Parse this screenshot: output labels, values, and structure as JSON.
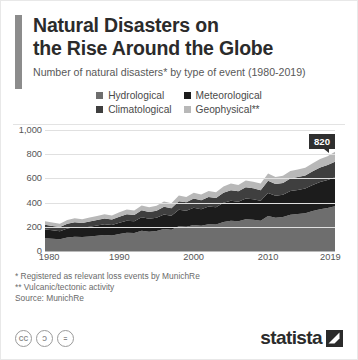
{
  "header": {
    "title_line1": "Natural Disasters on",
    "title_line2": "the Rise Around the Globe",
    "subtitle": "Number of natural disasters* by type of event (1980-2019)"
  },
  "legend": [
    {
      "label": "Hydrological",
      "color": "#6e6e6e"
    },
    {
      "label": "Meteorological",
      "color": "#1c1c1c"
    },
    {
      "label": "Climatological",
      "color": "#3f3f3f"
    },
    {
      "label": "Geophysical**",
      "color": "#b8b8b8"
    }
  ],
  "callout": {
    "value": "820"
  },
  "notes": {
    "note1": "*  Registered as relevant loss events by MunichRe",
    "note2": "** Vulcanic/tectonic activity",
    "source": "Source: MunichRe"
  },
  "footer": {
    "cc_icons": [
      "cc",
      "by",
      "nd"
    ],
    "cc_glyphs": [
      "CC",
      "Ɔ",
      "="
    ],
    "brand": "statista"
  },
  "chart_data": {
    "type": "area",
    "stacked": true,
    "title": "Number of natural disasters* by type of event (1980-2019)",
    "xlabel": "",
    "ylabel": "",
    "ylim": [
      0,
      1000
    ],
    "yticks": [
      0,
      200,
      400,
      600,
      800,
      1000
    ],
    "ytick_labels": [
      "0",
      "200",
      "400",
      "600",
      "800",
      "1,000"
    ],
    "xlim": [
      1980,
      2019
    ],
    "xticks": [
      1980,
      1990,
      2000,
      2010,
      2019
    ],
    "xtick_labels": [
      "1980",
      "1990",
      "2000",
      "2010",
      "2019"
    ],
    "grid": true,
    "legend_position": "top",
    "x": [
      1980,
      1981,
      1982,
      1983,
      1984,
      1985,
      1986,
      1987,
      1988,
      1989,
      1990,
      1991,
      1992,
      1993,
      1994,
      1995,
      1996,
      1997,
      1998,
      1999,
      2000,
      2001,
      2002,
      2003,
      2004,
      2005,
      2006,
      2007,
      2008,
      2009,
      2010,
      2011,
      2012,
      2013,
      2014,
      2015,
      2016,
      2017,
      2018,
      2019
    ],
    "series": [
      {
        "name": "Hydrological",
        "color": "#6e6e6e",
        "values": [
          106,
          101,
          98,
          112,
          118,
          116,
          120,
          126,
          133,
          128,
          140,
          150,
          148,
          168,
          160,
          165,
          182,
          175,
          205,
          200,
          215,
          208,
          222,
          218,
          240,
          250,
          245,
          262,
          258,
          250,
          290,
          275,
          280,
          300,
          305,
          312,
          330,
          345,
          355,
          370
        ]
      },
      {
        "name": "Meteorological",
        "color": "#1c1c1c",
        "values": [
          72,
          70,
          66,
          74,
          78,
          76,
          80,
          84,
          88,
          86,
          94,
          100,
          98,
          110,
          106,
          110,
          120,
          116,
          135,
          132,
          142,
          138,
          146,
          144,
          158,
          165,
          162,
          172,
          170,
          165,
          190,
          182,
          185,
          196,
          200,
          205,
          215,
          225,
          232,
          240
        ]
      },
      {
        "name": "Climatological",
        "color": "#3f3f3f",
        "values": [
          38,
          36,
          34,
          40,
          42,
          40,
          44,
          46,
          48,
          46,
          50,
          54,
          52,
          58,
          56,
          58,
          64,
          62,
          72,
          70,
          76,
          74,
          78,
          76,
          84,
          88,
          86,
          92,
          90,
          88,
          100,
          96,
          98,
          104,
          106,
          108,
          114,
          120,
          124,
          128
        ]
      },
      {
        "name": "Geophysical**",
        "color": "#b8b8b8",
        "values": [
          30,
          29,
          28,
          31,
          32,
          31,
          33,
          34,
          35,
          34,
          36,
          38,
          37,
          40,
          39,
          40,
          43,
          42,
          46,
          45,
          48,
          47,
          49,
          48,
          52,
          54,
          53,
          56,
          55,
          54,
          60,
          58,
          59,
          62,
          63,
          64,
          67,
          70,
          72,
          82
        ]
      }
    ],
    "annotations": [
      {
        "x": 2019,
        "y": 820,
        "label": "820"
      }
    ]
  }
}
